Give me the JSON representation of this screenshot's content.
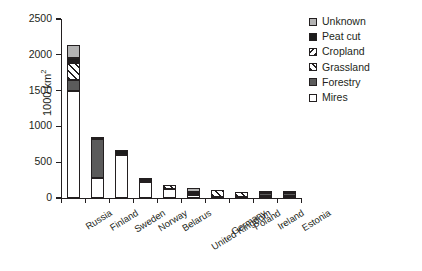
{
  "chart_data": {
    "type": "bar",
    "subtype": "stacked-bar",
    "title": "",
    "xlabel": "",
    "ylabel": "1000 km2",
    "ylabel_display": "1000 km",
    "ylabel_superscript": "2",
    "ylim": [
      0,
      2500
    ],
    "yticks": [
      0,
      500,
      1000,
      1500,
      2000,
      2500
    ],
    "ytick_labels": [
      "0",
      "500",
      "1000",
      "1500",
      "2000",
      "2500"
    ],
    "grid": false,
    "legend_position": "top-right",
    "categories": [
      "Russia",
      "Finland",
      "Sweden",
      "Norway",
      "Belarus",
      "United Kingdom",
      "Germany",
      "Poland",
      "Ireland",
      "Estonia"
    ],
    "series": [
      {
        "name": "Mires",
        "color": "#ffffff",
        "pattern": "solid-white",
        "values": [
          1500,
          280,
          600,
          230,
          120,
          45,
          15,
          15,
          30,
          25
        ]
      },
      {
        "name": "Forestry",
        "color": "#5b5b5b",
        "pattern": "solid-gray",
        "values": [
          150,
          545,
          0,
          0,
          0,
          25,
          0,
          0,
          35,
          45
        ]
      },
      {
        "name": "Grassland",
        "color": "#ffffff",
        "pattern": "hatch-forward",
        "values": [
          230,
          0,
          0,
          0,
          60,
          0,
          100,
          65,
          0,
          0
        ]
      },
      {
        "name": "Cropland",
        "color": "#ffffff",
        "pattern": "hatch-backward",
        "values": [
          40,
          0,
          0,
          25,
          0,
          0,
          0,
          0,
          0,
          0
        ]
      },
      {
        "name": "Peat cut",
        "color": "#1c1c1c",
        "pattern": "solid-black",
        "values": [
          35,
          30,
          75,
          30,
          0,
          15,
          0,
          0,
          25,
          20
        ]
      },
      {
        "name": "Unknown",
        "color": "#b3b3b3",
        "pattern": "solid-lightgray",
        "values": [
          180,
          0,
          0,
          0,
          0,
          55,
          0,
          0,
          0,
          0
        ]
      }
    ],
    "totals": [
      2135,
      855,
      675,
      285,
      180,
      140,
      115,
      80,
      90,
      90
    ]
  },
  "legend": {
    "items": [
      {
        "label": "Unknown",
        "pattern": "solid-lightgray"
      },
      {
        "label": "Peat cut",
        "pattern": "solid-black"
      },
      {
        "label": "Cropland",
        "pattern": "hatch-backward"
      },
      {
        "label": "Grassland",
        "pattern": "hatch-forward"
      },
      {
        "label": "Forestry",
        "pattern": "solid-gray"
      },
      {
        "label": "Mires",
        "pattern": "solid-white"
      }
    ]
  }
}
